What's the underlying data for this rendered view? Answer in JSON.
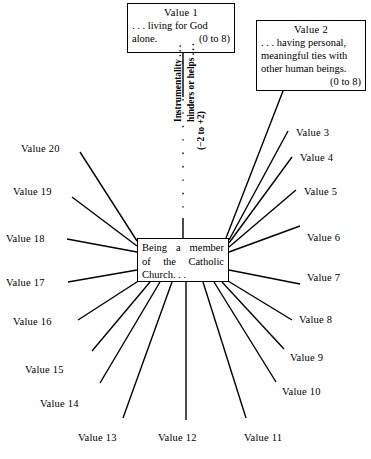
{
  "diagram": {
    "type": "radial-spoke-diagram",
    "center": {
      "line1": "Being a member",
      "line2": "of the Catholic",
      "line3": "Church. . ."
    },
    "axis_caption": {
      "line1": "Instrumentality . . .",
      "line2": "hinders or helps . . .",
      "line3": "(−2 to +2)"
    },
    "boxes": [
      {
        "title": "Value 1",
        "line1": ". . . living for God",
        "line2": "alone.",
        "range": "(0 to 8)"
      },
      {
        "title": "Value 2",
        "line1": ". . . having personal,",
        "line2": "meaningful ties with",
        "line3": "other human beings.",
        "range": "(0 to 8)"
      }
    ],
    "spokes": [
      {
        "label": "Value 3"
      },
      {
        "label": "Value 4"
      },
      {
        "label": "Value 5"
      },
      {
        "label": "Value 6"
      },
      {
        "label": "Value 7"
      },
      {
        "label": "Value 8"
      },
      {
        "label": "Value 9"
      },
      {
        "label": "Value 10"
      },
      {
        "label": "Value 11"
      },
      {
        "label": "Value 12"
      },
      {
        "label": "Value 13"
      },
      {
        "label": "Value 14"
      },
      {
        "label": "Value 15"
      },
      {
        "label": "Value 16"
      },
      {
        "label": "Value 17"
      },
      {
        "label": "Value 18"
      },
      {
        "label": "Value 19"
      },
      {
        "label": "Value 20"
      }
    ],
    "colors": {
      "stroke": "#000000",
      "background": "#ffffff"
    }
  }
}
